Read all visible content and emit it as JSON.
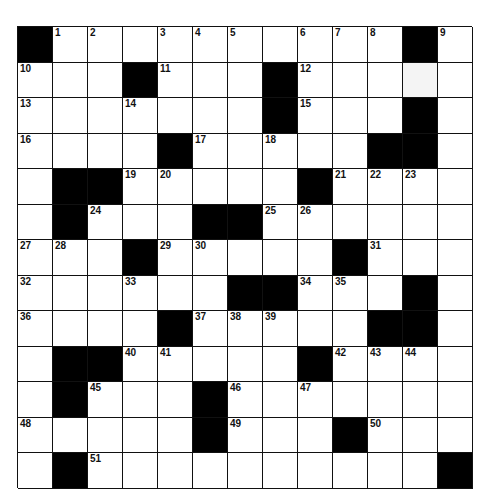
{
  "puzzle": {
    "rows": 13,
    "cols": 13,
    "colors": {
      "black": "#000000",
      "white": "#ffffff",
      "line": "#111111"
    },
    "grid": [
      [
        "#",
        "1",
        "2",
        ".",
        "3",
        "4",
        "5",
        ".",
        "6",
        "7",
        "8",
        "#",
        "9"
      ],
      [
        "10",
        ".",
        ".",
        "#",
        "11",
        ".",
        ".",
        "#",
        "12",
        ".",
        ".",
        "~",
        "."
      ],
      [
        "13",
        ".",
        ".",
        "14",
        ".",
        ".",
        ".",
        "#",
        "15",
        ".",
        ".",
        "#",
        "."
      ],
      [
        "16",
        ".",
        ".",
        ".",
        "#",
        "17",
        ".",
        "18",
        ".",
        ".",
        "#",
        "#",
        "."
      ],
      [
        ".",
        "#",
        "#",
        "19",
        "20",
        ".",
        ".",
        ".",
        "#",
        "21",
        "22",
        "23",
        "."
      ],
      [
        ".",
        "#",
        "24",
        ".",
        ".",
        "#",
        "#",
        "25",
        "26",
        ".",
        ".",
        ".",
        "."
      ],
      [
        "27",
        "28",
        ".",
        "#",
        "29",
        "30",
        ".",
        ".",
        ".",
        "#",
        "31",
        ".",
        "."
      ],
      [
        "32",
        ".",
        ".",
        "33",
        ".",
        ".",
        "#",
        "#",
        "34",
        "35",
        ".",
        "#",
        "."
      ],
      [
        "36",
        ".",
        ".",
        ".",
        "#",
        "37",
        "38",
        "39",
        ".",
        ".",
        "#",
        "#",
        "."
      ],
      [
        ".",
        "#",
        "#",
        "40",
        "41",
        ".",
        ".",
        ".",
        "#",
        "42",
        "43",
        "44",
        "."
      ],
      [
        ".",
        "#",
        "45",
        ".",
        ".",
        "#",
        "46",
        ".",
        "47",
        ".",
        ".",
        ".",
        "."
      ],
      [
        "48",
        ".",
        ".",
        ".",
        ".",
        "#",
        "49",
        ".",
        ".",
        "#",
        "50",
        ".",
        "."
      ],
      [
        ".",
        "#",
        "51",
        ".",
        ".",
        ".",
        ".",
        ".",
        ".",
        ".",
        ".",
        ".",
        "#"
      ]
    ]
  }
}
